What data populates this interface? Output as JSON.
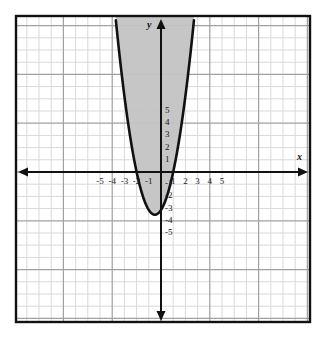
{
  "figure": {
    "kind": "coordinate-plane-with-shaded-parabola",
    "axis_labels": {
      "x": "x",
      "y": "y"
    },
    "frame": {
      "left": 16,
      "top": 16,
      "right": 310,
      "bottom": 322
    },
    "origin_px": {
      "x": 161,
      "y": 172
    },
    "unit_px": 12.2,
    "colors": {
      "background": "#ffffff",
      "grid_minor": "#d8d8d8",
      "grid_major": "#9a9a9a",
      "frame": "#111111",
      "axis": "#111111",
      "curve": "#111111",
      "shade_fill": "#c3c3c3",
      "label_text": "#1a1a1a"
    }
  },
  "chart_data": {
    "type": "line",
    "title": "",
    "xlabel": "x",
    "ylabel": "y",
    "xlim": [
      -6.0,
      6.2
    ],
    "ylim": [
      -6.4,
      6.4
    ],
    "grid": true,
    "grid_step": 1,
    "legend": "none",
    "x_ticks": [
      -5,
      -4,
      -3,
      -2,
      -1,
      1,
      2,
      3,
      4,
      5
    ],
    "x_tick_labels": [
      "-5",
      "-4",
      "-3",
      "-2",
      "-1",
      "1",
      "2",
      "3",
      "4",
      "5"
    ],
    "y_ticks": [
      5,
      4,
      3,
      2,
      1,
      -1,
      -2,
      -3,
      -4,
      -5
    ],
    "y_tick_labels": [
      "5",
      "4",
      "3",
      "2",
      "1",
      "-1",
      "-2",
      "-3",
      "-4",
      "-5"
    ],
    "series": [
      {
        "name": "parabola",
        "kind": "quadratic",
        "equation": "y = (14/9)(x + 2)(x - 1)",
        "vertex": [
          -0.5,
          -3.5
        ],
        "roots": [
          -2,
          1
        ],
        "opens": "up",
        "x": [
          -2.6,
          -2.4,
          -2.2,
          -2.0,
          -1.8,
          -1.6,
          -1.4,
          -1.2,
          -1.0,
          -0.8,
          -0.6,
          -0.5,
          -0.4,
          -0.2,
          0.0,
          0.2,
          0.4,
          0.6,
          0.8,
          1.0,
          1.2,
          1.4,
          1.6
        ],
        "values": [
          5.6,
          3.9,
          2.4,
          0.0,
          -1.2,
          -2.2,
          -3.0,
          -3.4,
          -3.1,
          -3.4,
          -3.5,
          -3.5,
          -3.5,
          -3.3,
          -3.1,
          -2.7,
          -2.2,
          -1.6,
          -0.9,
          0.0,
          1.1,
          2.3,
          3.7
        ]
      }
    ],
    "shaded_region": {
      "description": "interior of parabola shaded gray",
      "inequality": "y >= (14/9)(x + 2)(x - 1)",
      "fill": "#c3c3c3"
    },
    "annotations": []
  }
}
